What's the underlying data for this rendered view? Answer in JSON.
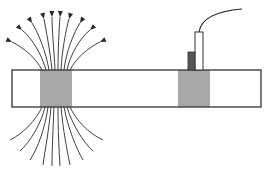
{
  "diagram": {
    "colors": {
      "background": "#ffffff",
      "outline": "#333333",
      "pole_region": "#a8a8a8",
      "field_line": "#2a2a2a",
      "probe_body": "#ffffff",
      "probe_element": "#555555",
      "cable": "#222222"
    },
    "bar": {
      "x": 12,
      "y": 70,
      "width": 249,
      "height": 37
    },
    "pole_regions": [
      {
        "id": "left-pole",
        "x": 40,
        "y": 70,
        "width": 32,
        "height": 37
      },
      {
        "id": "right-pole",
        "x": 178,
        "y": 70,
        "width": 32,
        "height": 37
      }
    ],
    "probe": {
      "body": {
        "x": 195,
        "y": 32,
        "width": 8,
        "height": 38
      },
      "sensor": {
        "x": 188,
        "y": 52,
        "width": 7,
        "height": 18
      },
      "cable_path": "M199,32 C201,18 218,11 242,9"
    },
    "field_lines_top": [
      "M42,70 C36,58 24,48 12,42",
      "M46,70 C42,55 32,38 22,30",
      "M49,70 C46,52 38,32 32,23",
      "M52,70 C50,50 46,30 44,19",
      "M55,70 C54,50 52,30 52,17",
      "M58,70 C58,50 59,30 60,17",
      "M61,70 C62,50 66,30 69,19",
      "M64,70 C66,52 74,32 80,23",
      "M67,70 C70,55 80,38 90,30",
      "M70,70 C76,58 88,48 100,42"
    ],
    "field_lines_bottom": [
      "M42,107 C36,120 24,133 10,140",
      "M45,107 C41,124 30,142 20,151",
      "M48,107 C45,128 38,148 30,160",
      "M51,107 C49,130 45,150 43,165",
      "M54,107 C53,130 52,150 52,166",
      "M58,107 C58,130 59,150 60,166",
      "M61,107 C63,130 67,150 70,165",
      "M64,107 C68,128 76,148 83,160",
      "M67,107 C72,124 83,142 93,151",
      "M70,107 C76,120 88,133 103,140"
    ],
    "arrow_heads": [
      {
        "tip": [
          12,
          42
        ],
        "angle": 205
      },
      {
        "tip": [
          22,
          30
        ],
        "angle": 222
      },
      {
        "tip": [
          32,
          23
        ],
        "angle": 238
      },
      {
        "tip": [
          44,
          19
        ],
        "angle": 255
      },
      {
        "tip": [
          52,
          17
        ],
        "angle": 268
      },
      {
        "tip": [
          60,
          17
        ],
        "angle": 274
      },
      {
        "tip": [
          69,
          19
        ],
        "angle": 286
      },
      {
        "tip": [
          80,
          23
        ],
        "angle": 302
      },
      {
        "tip": [
          90,
          30
        ],
        "angle": 318
      },
      {
        "tip": [
          100,
          42
        ],
        "angle": 335
      }
    ]
  }
}
